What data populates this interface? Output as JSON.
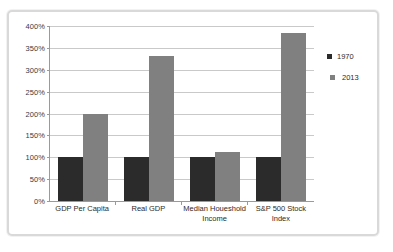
{
  "chart_data": {
    "type": "bar",
    "title": "",
    "subtitle": "",
    "xlabel": "",
    "ylabel": "",
    "ylim": [
      0,
      400
    ],
    "ytick_step": 50,
    "ytick_labels": [
      "0%",
      "50%",
      "100%",
      "150%",
      "200%",
      "250%",
      "300%",
      "350%",
      "400%"
    ],
    "ytick_values": [
      0,
      50,
      100,
      150,
      200,
      250,
      300,
      350,
      400
    ],
    "grid": true,
    "legend_position": "right",
    "categories": [
      "GDP Per Capita",
      "Real GDP",
      "Median Houeshold Income",
      "S&P 500 Stock Index"
    ],
    "series": [
      {
        "name": "1970",
        "color": "#2b2b2b",
        "values": [
          100,
          100,
          100,
          100
        ]
      },
      {
        "name": "2013",
        "color": "#808080",
        "values": [
          200,
          332,
          111,
          383
        ]
      }
    ]
  },
  "legend": {
    "entries": [
      {
        "label": "1970"
      },
      {
        "label": "2013"
      }
    ]
  },
  "colors": {
    "series_1970": "#2b2b2b",
    "series_2013": "#808080",
    "gridline": "#c9c9c9",
    "axis": "#9a9a9a",
    "frame": "#d9d9d9",
    "background": "#ffffff",
    "text": "#2b2b2b"
  }
}
